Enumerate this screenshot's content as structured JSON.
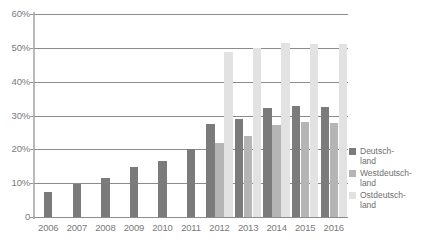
{
  "chart_data": {
    "type": "bar",
    "title": "",
    "subtitle": "",
    "xlabel": "",
    "ylabel": "",
    "categories": [
      "2006",
      "2007",
      "2008",
      "2009",
      "2010",
      "2011",
      "2012",
      "2013",
      "2014",
      "2015",
      "2016"
    ],
    "ylim": [
      0,
      60
    ],
    "ytick_values": [
      0,
      10,
      20,
      30,
      40,
      50,
      60
    ],
    "ytick_labels": [
      "0",
      "10%",
      "20%",
      "30%",
      "40%",
      "50%",
      "60%"
    ],
    "grid": true,
    "legend_position": "right",
    "series": [
      {
        "name": "Deutschland",
        "color": "#7b7b7b",
        "values": [
          7.5,
          9.7,
          11.5,
          14.8,
          16.7,
          20.0,
          27.4,
          29.1,
          32.1,
          32.7,
          32.4
        ]
      },
      {
        "name": "Westdeutschland",
        "color": "#b5b5b5",
        "values": [
          null,
          null,
          null,
          null,
          null,
          null,
          22.0,
          24.0,
          27.1,
          28.0,
          27.7
        ]
      },
      {
        "name": "Ostdeutschland",
        "color": "#e2e2e2",
        "values": [
          null,
          null,
          null,
          null,
          null,
          null,
          48.8,
          50.0,
          51.4,
          51.2,
          51.0
        ]
      }
    ]
  },
  "legend": {
    "items": [
      {
        "label": "Deutschland",
        "line1": "Deutsch-",
        "line2": "land",
        "color": "#7b7b7b"
      },
      {
        "label": "Westdeutschland",
        "line1": "Westdeutsch-",
        "line2": "land",
        "color": "#b5b5b5"
      },
      {
        "label": "Ostdeutschland",
        "line1": "Ostdeutsch-",
        "line2": "land",
        "color": "#e2e2e2"
      }
    ]
  },
  "axes": {
    "y_labels": [
      "60%",
      "50%",
      "40%",
      "30%",
      "20%",
      "10%",
      "0"
    ],
    "x_labels": [
      "2006",
      "2007",
      "2008",
      "2009",
      "2010",
      "2011",
      "2012",
      "2013",
      "2014",
      "2015",
      "2016"
    ]
  },
  "colors": {
    "series_dark": "#7b7b7b",
    "series_mid": "#b5b5b5",
    "series_light": "#e2e2e2",
    "gridline": "#8c8c8c",
    "text": "#7a7a7a",
    "background": "#ffffff"
  }
}
